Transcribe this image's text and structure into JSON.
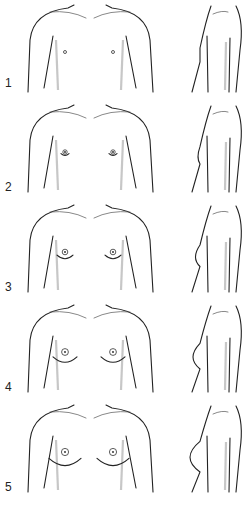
{
  "figure": {
    "stages": [
      {
        "label": "1",
        "stage": 1
      },
      {
        "label": "2",
        "stage": 2
      },
      {
        "label": "3",
        "stage": 3
      },
      {
        "label": "4",
        "stage": 4
      },
      {
        "label": "5",
        "stage": 5
      }
    ]
  }
}
